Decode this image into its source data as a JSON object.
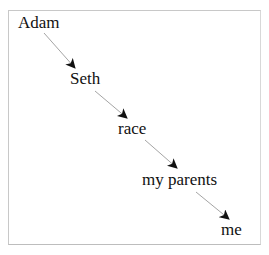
{
  "diagram": {
    "type": "chain",
    "nodes": [
      {
        "id": "n1",
        "label": "Adam"
      },
      {
        "id": "n2",
        "label": "Seth"
      },
      {
        "id": "n3",
        "label": "race"
      },
      {
        "id": "n4",
        "label": "my parents"
      },
      {
        "id": "n5",
        "label": "me"
      }
    ],
    "edges": [
      {
        "from": "Adam",
        "to": "Seth"
      },
      {
        "from": "Seth",
        "to": "race"
      },
      {
        "from": "race",
        "to": "my parents"
      },
      {
        "from": "my parents",
        "to": "me"
      }
    ],
    "colors": {
      "line": "#9a9a9a",
      "arrowhead": "#111111",
      "text": "#111111",
      "frame": "#c8c8c8"
    }
  }
}
